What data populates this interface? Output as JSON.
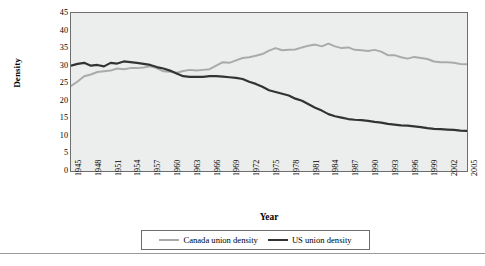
{
  "chart_data": {
    "type": "line",
    "title": "",
    "xlabel": "Year",
    "ylabel": "Density",
    "ylim": [
      0,
      45
    ],
    "ytick_step": 5,
    "yticks": [
      "0",
      "5",
      "10",
      "15",
      "20",
      "25",
      "30",
      "35",
      "40",
      "45"
    ],
    "grid": false,
    "legend_position": "bottom",
    "x_start": 1945,
    "x_end": 2005,
    "xticks": [
      "1945",
      "1948",
      "1951",
      "1954",
      "1957",
      "1960",
      "1963",
      "1966",
      "1969",
      "1972",
      "1975",
      "1978",
      "1981",
      "1984",
      "1987",
      "1990",
      "1993",
      "1996",
      "1999",
      "2002",
      "2005"
    ],
    "categories": [
      1945,
      1946,
      1947,
      1948,
      1949,
      1950,
      1951,
      1952,
      1953,
      1954,
      1955,
      1956,
      1957,
      1958,
      1959,
      1960,
      1961,
      1962,
      1963,
      1964,
      1965,
      1966,
      1967,
      1968,
      1969,
      1970,
      1971,
      1972,
      1973,
      1974,
      1975,
      1976,
      1977,
      1978,
      1979,
      1980,
      1981,
      1982,
      1983,
      1984,
      1985,
      1986,
      1987,
      1988,
      1989,
      1990,
      1991,
      1992,
      1993,
      1994,
      1995,
      1996,
      1997,
      1998,
      1999,
      2000,
      2001,
      2002,
      2003,
      2004,
      2005
    ],
    "series": [
      {
        "name": "Canada union density",
        "color": "#aaaaaa",
        "values": [
          24.2,
          25.5,
          27.0,
          27.5,
          28.2,
          28.4,
          28.6,
          29.2,
          29.0,
          29.3,
          29.3,
          29.5,
          29.8,
          29.3,
          28.4,
          28.3,
          28.0,
          28.5,
          28.8,
          28.6,
          28.8,
          29.0,
          30.0,
          31.0,
          30.8,
          31.5,
          32.2,
          32.4,
          32.8,
          33.3,
          34.3,
          35.0,
          34.4,
          34.5,
          34.6,
          35.2,
          35.7,
          36.0,
          35.5,
          36.3,
          35.5,
          35.0,
          35.2,
          34.5,
          34.4,
          34.2,
          34.5,
          34.0,
          33.0,
          33.0,
          32.4,
          32.0,
          32.5,
          32.2,
          31.9,
          31.2,
          31.0,
          31.0,
          30.8,
          30.5,
          30.4
        ]
      },
      {
        "name": "US union density",
        "color": "#333333",
        "values": [
          30.0,
          30.5,
          30.8,
          30.0,
          30.2,
          29.8,
          30.8,
          30.6,
          31.2,
          31.0,
          30.8,
          30.5,
          30.2,
          29.6,
          29.2,
          28.6,
          27.8,
          27.0,
          26.8,
          26.8,
          26.8,
          27.0,
          27.0,
          26.9,
          26.7,
          26.5,
          26.2,
          25.4,
          24.8,
          24.0,
          23.0,
          22.5,
          22.0,
          21.5,
          20.6,
          20.0,
          19.0,
          18.0,
          17.2,
          16.2,
          15.6,
          15.2,
          14.8,
          14.6,
          14.5,
          14.3,
          14.0,
          13.8,
          13.4,
          13.2,
          13.0,
          12.9,
          12.7,
          12.5,
          12.2,
          12.0,
          11.9,
          11.8,
          11.7,
          11.5,
          11.4
        ]
      }
    ]
  },
  "legend": {
    "items": [
      {
        "label": "Canada union density",
        "color": "#aaaaaa"
      },
      {
        "label": "US union density",
        "color": "#333333"
      }
    ]
  }
}
